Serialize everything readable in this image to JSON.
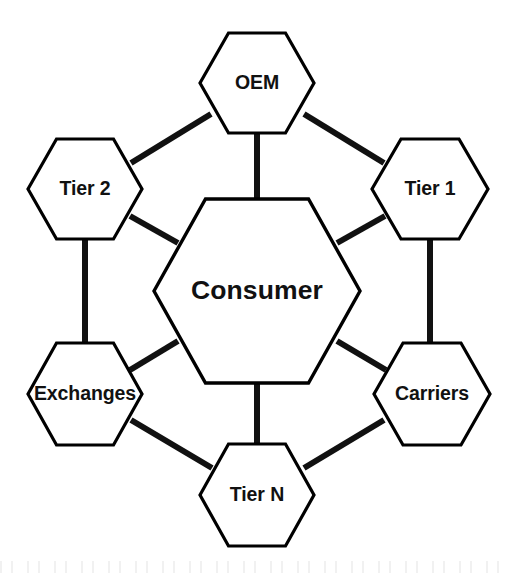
{
  "diagram": {
    "background_color": "#ffffff",
    "stroke_color": "#000000",
    "edge_color": "#111111",
    "text_color": "#111111",
    "center": {
      "id": "consumer",
      "label": "Consumer",
      "cx": 257,
      "cy": 291,
      "rx": 103,
      "ry": 92,
      "font_size": 26.5
    },
    "nodes": [
      {
        "id": "oem",
        "label": "OEM",
        "cx": 257,
        "cy": 83,
        "rx": 57,
        "ry": 50,
        "font_size": 19.5,
        "position": "top"
      },
      {
        "id": "tier1",
        "label": "Tier 1",
        "cx": 430,
        "cy": 189,
        "rx": 58,
        "ry": 50,
        "font_size": 19.5,
        "position": "upper-right"
      },
      {
        "id": "carriers",
        "label": "Carriers",
        "cx": 432,
        "cy": 394,
        "rx": 58,
        "ry": 51,
        "font_size": 19.5,
        "position": "lower-right"
      },
      {
        "id": "tiern",
        "label": "Tier N",
        "cx": 257,
        "cy": 495,
        "rx": 57,
        "ry": 51,
        "font_size": 19.5,
        "position": "bottom"
      },
      {
        "id": "exchanges",
        "label": "Exchanges",
        "cx": 85,
        "cy": 394,
        "rx": 57,
        "ry": 51,
        "font_size": 19.5,
        "position": "lower-left"
      },
      {
        "id": "tier2",
        "label": "Tier 2",
        "cx": 85,
        "cy": 189,
        "rx": 57,
        "ry": 50,
        "font_size": 19.5,
        "position": "upper-left"
      }
    ],
    "edges": [
      {
        "id": "edge-oem-consumer",
        "from": "oem",
        "to": "consumer",
        "x1": 257,
        "y1": 133,
        "x2": 257,
        "y2": 202,
        "kind": "vertical"
      },
      {
        "id": "edge-tier2-oem",
        "from": "tier2",
        "to": "oem",
        "x1": 131,
        "y1": 163,
        "x2": 211,
        "y2": 114,
        "kind": "diagonal"
      },
      {
        "id": "edge-oem-tier1",
        "from": "oem",
        "to": "tier1",
        "x1": 304,
        "y1": 114,
        "x2": 384,
        "y2": 163,
        "kind": "diagonal"
      },
      {
        "id": "edge-tier2-consumer",
        "from": "tier2",
        "to": "consumer",
        "x1": 130,
        "y1": 216,
        "x2": 178,
        "y2": 243,
        "kind": "diagonal"
      },
      {
        "id": "edge-consumer-tier1",
        "from": "consumer",
        "to": "tier1",
        "x1": 337,
        "y1": 243,
        "x2": 385,
        "y2": 216,
        "kind": "diagonal"
      },
      {
        "id": "edge-tier2-exchanges",
        "from": "tier2",
        "to": "exchanges",
        "x1": 85,
        "y1": 238,
        "x2": 85,
        "y2": 345,
        "kind": "vertical"
      },
      {
        "id": "edge-tier1-carriers",
        "from": "tier1",
        "to": "carriers",
        "x1": 430,
        "y1": 238,
        "x2": 430,
        "y2": 345,
        "kind": "vertical"
      },
      {
        "id": "edge-exchanges-consumer",
        "from": "exchanges",
        "to": "consumer",
        "x1": 130,
        "y1": 370,
        "x2": 178,
        "y2": 341,
        "kind": "diagonal"
      },
      {
        "id": "edge-consumer-carriers",
        "from": "consumer",
        "to": "carriers",
        "x1": 337,
        "y1": 341,
        "x2": 386,
        "y2": 370,
        "kind": "diagonal"
      },
      {
        "id": "edge-exchanges-tiern",
        "from": "exchanges",
        "to": "tiern",
        "x1": 131,
        "y1": 420,
        "x2": 212,
        "y2": 468,
        "kind": "diagonal"
      },
      {
        "id": "edge-consumer-tiern",
        "from": "consumer",
        "to": "tiern",
        "x1": 257,
        "y1": 380,
        "x2": 257,
        "y2": 450,
        "kind": "vertical"
      },
      {
        "id": "edge-tiern-carriers",
        "from": "tiern",
        "to": "carriers",
        "x1": 304,
        "y1": 468,
        "x2": 384,
        "y2": 420,
        "kind": "diagonal"
      }
    ]
  }
}
